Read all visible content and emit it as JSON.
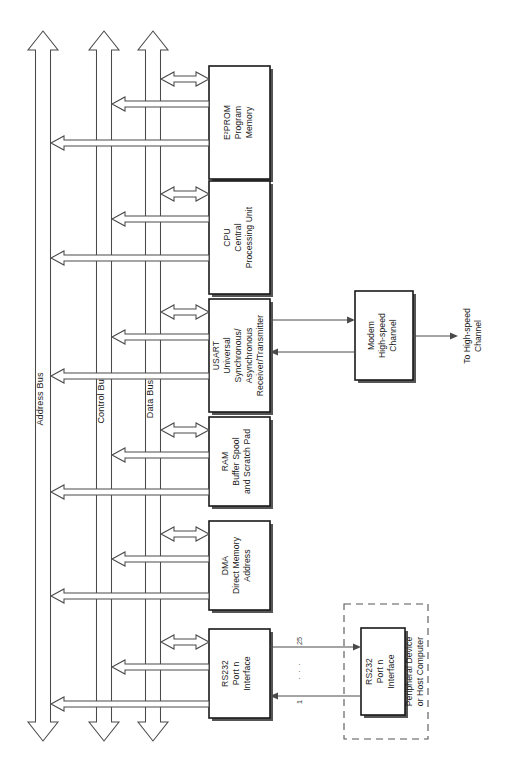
{
  "diagram": {
    "orientation": "rotated-90-ccw",
    "buses": [
      {
        "id": "address-bus",
        "label": "Address Bus"
      },
      {
        "id": "control-bus",
        "label": "Control Bus"
      },
      {
        "id": "data-bus",
        "label": "Data Bus"
      }
    ],
    "modules": [
      {
        "id": "eeprom",
        "lines": [
          "E²PROM",
          "Program",
          "Memory"
        ]
      },
      {
        "id": "cpu",
        "lines": [
          "CPU",
          "Central",
          "Processing Unit"
        ]
      },
      {
        "id": "usart",
        "lines": [
          "USART",
          "Universal",
          "Synchronous/",
          "Asynchronous",
          "Receiver/Transmitter"
        ]
      },
      {
        "id": "ram",
        "lines": [
          "RAM",
          "Buffer Spool",
          "and Scratch Pad"
        ]
      },
      {
        "id": "dma",
        "lines": [
          "DMA",
          "Direct Memory",
          "Address"
        ]
      },
      {
        "id": "rs232-internal",
        "lines": [
          "RS232",
          "Port n",
          "Interface"
        ]
      }
    ],
    "modem": {
      "id": "modem",
      "lines": [
        "Modem",
        "High-speed",
        "Channel"
      ]
    },
    "external_channel": {
      "id": "to-high-speed-channel",
      "lines": [
        "To High-speed",
        "Channel"
      ]
    },
    "peripheral": {
      "id": "peripheral-device",
      "enclosure_lines": [
        "Peripheral Device",
        "or Host Computer"
      ],
      "box_lines": [
        "RS232",
        "Port n",
        "Interface"
      ]
    },
    "pin_labels": {
      "top": "25",
      "middle": "·  ·  ·",
      "bottom": "1"
    },
    "colors": {
      "box_stroke": "#1a1a1a",
      "arrow_stroke": "#4a4a4a",
      "dashed_stroke": "#555555",
      "background": "#ffffff",
      "text": "#1a1a1a"
    }
  }
}
